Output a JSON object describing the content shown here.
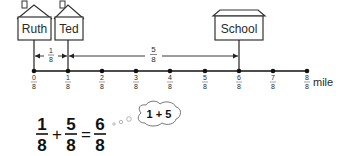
{
  "diagram": {
    "type": "number-line-addition",
    "locations": [
      {
        "name": "Ruth",
        "position": 0
      },
      {
        "name": "Ted",
        "position": 1
      },
      {
        "name": "School",
        "position": 6
      }
    ],
    "distances": [
      {
        "from": "Ruth",
        "to": "Ted",
        "numerator": "1",
        "denominator": "8"
      },
      {
        "from": "Ted",
        "to": "School",
        "numerator": "5",
        "denominator": "8"
      }
    ],
    "number_line": {
      "unit": "mile",
      "denominator": "8",
      "ticks": [
        {
          "numerator": "0",
          "denominator": "8"
        },
        {
          "numerator": "1",
          "denominator": "8"
        },
        {
          "numerator": "2",
          "denominator": "8"
        },
        {
          "numerator": "3",
          "denominator": "8"
        },
        {
          "numerator": "4",
          "denominator": "8"
        },
        {
          "numerator": "5",
          "denominator": "8"
        },
        {
          "numerator": "6",
          "denominator": "8"
        },
        {
          "numerator": "7",
          "denominator": "8"
        },
        {
          "numerator": "8",
          "denominator": "8"
        }
      ]
    },
    "equation": {
      "term1": {
        "numerator": "1",
        "denominator": "8"
      },
      "plus": "+",
      "term2": {
        "numerator": "5",
        "denominator": "8"
      },
      "equals": "=",
      "result": {
        "numerator": "6",
        "denominator": "8"
      }
    },
    "thought_bubble": "1 + 5"
  }
}
